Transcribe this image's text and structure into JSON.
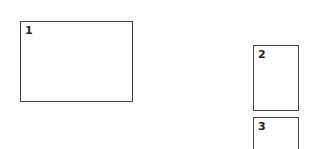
{
  "boxes": [
    {
      "label": "1",
      "x": 20,
      "y": 21,
      "w": 113,
      "h": 81
    },
    {
      "label": "2",
      "x": 253,
      "y": 45,
      "w": 46,
      "h": 66
    },
    {
      "label": "3",
      "x": 253,
      "y": 117,
      "w": 46,
      "h": 40
    }
  ]
}
